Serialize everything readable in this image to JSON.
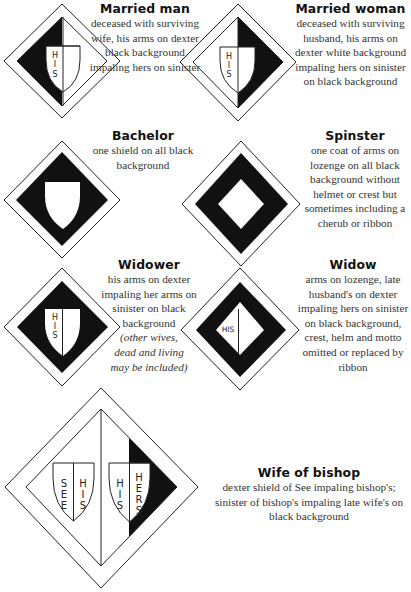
{
  "panels": [
    {
      "id": "married-man",
      "title": "Married man",
      "description": "deceased  with surviving wife, his arms on dexter black background impaling hers on sinister",
      "shield_letters": [
        "H",
        "I",
        "S"
      ]
    },
    {
      "id": "married-woman",
      "title": "Married woman",
      "description": "deceased with surviving husband, his arms on dexter white background impaling hers on sinister on black background",
      "shield_letters": [
        "H",
        "I",
        "S"
      ]
    },
    {
      "id": "bachelor",
      "title": "Bachelor",
      "description": "one shield on all black background"
    },
    {
      "id": "spinster",
      "title": "Spinster",
      "description": "one coat of arms on lozenge on all black background without helmet or crest but sometimes including a cherub or ribbon"
    },
    {
      "id": "widower",
      "title": "Widower",
      "description": "his arms on dexter impaling her arms on sinister on black background",
      "note": "(other wives, dead and living may be included)",
      "shield_letters": [
        "H",
        "I",
        "S"
      ]
    },
    {
      "id": "widow",
      "title": "Widow",
      "description": "arms on lozenge, late husband's on dexter impaling hers on sinister on black background, crest, helm and motto omitted or replaced by ribbon",
      "lozenge_label": "HIS"
    },
    {
      "id": "wife-of-bishop",
      "title": "Wife of bishop",
      "description": "dexter shield of See impaling bishop's; sinister of bishop's impaling late wife's on black background",
      "left_shield": {
        "dexter": [
          "S",
          "E",
          "E"
        ],
        "sinister": [
          "H",
          "I",
          "S"
        ]
      },
      "right_shield": {
        "dexter": [
          "H",
          "I",
          "S"
        ],
        "sinister": [
          "H",
          "E",
          "R",
          "S"
        ]
      }
    }
  ],
  "colors": {
    "ink": "#111111",
    "paper": "#ffffff",
    "text": "#333333"
  }
}
